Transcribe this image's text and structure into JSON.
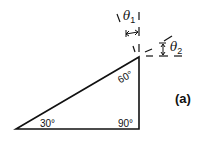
{
  "diagram": {
    "triangle": {
      "angles": {
        "bottom_left": "30°",
        "top_right": "60°",
        "bottom_right": "90°"
      }
    },
    "theta1": {
      "symbol": "θ",
      "subscript": "1"
    },
    "theta2": {
      "symbol": "θ",
      "subscript": "2"
    },
    "panel_label": "(a)",
    "colors": {
      "line": "#111111",
      "background": "#ffffff"
    }
  }
}
